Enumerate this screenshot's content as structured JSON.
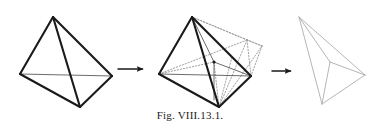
{
  "figure": {
    "caption": "Fig. VIII.13.1.",
    "background_color": "#ffffff",
    "solid_stroke_color": "#1a1a1a",
    "thin_stroke_color": "#5a5a5a",
    "dotted_stroke_color": "#9a9a9a",
    "ghost_stroke_color": "#a8a8a8",
    "arrow_color": "#1a1a1a",
    "panels": [
      {
        "name": "tetrahedron-solid",
        "label": "solid tetrahedron",
        "vertices": {
          "apex": [
            53,
            17
          ],
          "left": [
            20,
            74
          ],
          "right": [
            112,
            76
          ],
          "bottom": [
            80,
            107
          ]
        },
        "solid_edges": [
          [
            [
              53,
              17
            ],
            [
              20,
              74
            ]
          ],
          [
            [
              53,
              17
            ],
            [
              112,
              76
            ]
          ],
          [
            [
              53,
              17
            ],
            [
              80,
              107
            ]
          ],
          [
            [
              20,
              74
            ],
            [
              80,
              107
            ]
          ],
          [
            [
              112,
              76
            ],
            [
              80,
              107
            ]
          ]
        ],
        "thin_edges": [
          [
            [
              20,
              74
            ],
            [
              112,
              76
            ]
          ]
        ]
      },
      {
        "name": "tetrahedron-folding",
        "label": "tetrahedron with folded ghost copy",
        "vertices": {
          "apex": [
            192,
            17
          ],
          "left": [
            159,
            74
          ],
          "right": [
            251,
            76
          ],
          "bottom": [
            219,
            107
          ]
        },
        "solid_edges": [
          [
            [
              192,
              17
            ],
            [
              159,
              74
            ]
          ],
          [
            [
              192,
              17
            ],
            [
              251,
              76
            ]
          ],
          [
            [
              192,
              17
            ],
            [
              219,
              107
            ]
          ],
          [
            [
              159,
              74
            ],
            [
              219,
              107
            ]
          ],
          [
            [
              251,
              76
            ],
            [
              219,
              107
            ]
          ]
        ],
        "thin_edges": [
          [
            [
              159,
              74
            ],
            [
              251,
              76
            ]
          ],
          [
            [
              192,
              17
            ],
            [
              214,
              62
            ]
          ],
          [
            [
              192,
              17
            ],
            [
              232,
              57
            ]
          ],
          [
            [
              214,
              62
            ],
            [
              214,
              100
            ]
          ],
          [
            [
              214,
              62
            ],
            [
              251,
              76
            ]
          ]
        ],
        "dotted_edges": [
          [
            [
              192,
              17
            ],
            [
              262,
              46
            ]
          ],
          [
            [
              192,
              17
            ],
            [
              247,
              40
            ]
          ],
          [
            [
              262,
              46
            ],
            [
              251,
              76
            ]
          ],
          [
            [
              247,
              40
            ],
            [
              262,
              46
            ]
          ],
          [
            [
              247,
              40
            ],
            [
              251,
              76
            ]
          ],
          [
            [
              159,
              74
            ],
            [
              247,
              40
            ]
          ],
          [
            [
              159,
              74
            ],
            [
              214,
              62
            ]
          ],
          [
            [
              214,
              62
            ],
            [
              219,
              107
            ]
          ],
          [
            [
              219,
              107
            ],
            [
              262,
              46
            ]
          ],
          [
            [
              219,
              107
            ],
            [
              247,
              40
            ]
          ],
          [
            [
              232,
              57
            ],
            [
              251,
              76
            ]
          ],
          [
            [
              232,
              57
            ],
            [
              219,
              107
            ]
          ]
        ],
        "marker_point": [
          214,
          62
        ]
      },
      {
        "name": "tetrahedron-collapsed",
        "label": "collapsed flat tetrahedron",
        "vertices": {
          "apex": [
            299,
            17
          ],
          "inner": [
            330,
            62
          ],
          "right": [
            365,
            75
          ],
          "bottom": [
            322,
            104
          ]
        },
        "ghost_edges": [
          [
            [
              299,
              17
            ],
            [
              330,
              62
            ]
          ],
          [
            [
              299,
              17
            ],
            [
              365,
              75
            ]
          ],
          [
            [
              299,
              17
            ],
            [
              322,
              104
            ]
          ],
          [
            [
              330,
              62
            ],
            [
              365,
              75
            ]
          ],
          [
            [
              330,
              62
            ],
            [
              322,
              104
            ]
          ],
          [
            [
              365,
              75
            ],
            [
              322,
              104
            ]
          ]
        ]
      }
    ],
    "arrows": [
      {
        "name": "arrow-1",
        "from": [
          118,
          69
        ],
        "to": [
          148,
          69
        ]
      },
      {
        "name": "arrow-2",
        "from": [
          272,
          71
        ],
        "to": [
          296,
          71
        ]
      }
    ]
  }
}
